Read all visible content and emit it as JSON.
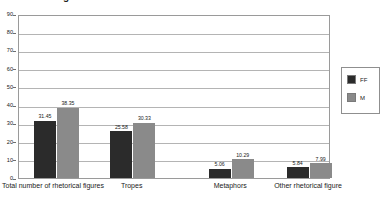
{
  "chart_data": {
    "type": "bar",
    "title": "Rhetorical figures",
    "xlabel": "",
    "ylabel": "",
    "ylim": [
      0,
      90
    ],
    "ytick_step": 10,
    "yticks": [
      0,
      10,
      20,
      30,
      40,
      50,
      60,
      70,
      80,
      90
    ],
    "grid": true,
    "legend_position": "right",
    "categories": [
      "Total number of rhetorical figures",
      "Tropes",
      "Metaphors",
      "Other rhetorical figure"
    ],
    "series": [
      {
        "name": "FF",
        "color": "#2b2b2b",
        "values": [
          31.45,
          25.58,
          5.06,
          5.84
        ],
        "labels": [
          "31.45",
          "25.58",
          "5.06",
          "5.84"
        ]
      },
      {
        "name": "M",
        "color": "#8a8a8a",
        "values": [
          38.35,
          30.33,
          10.29,
          7.99
        ],
        "labels": [
          "38.35",
          "30.33",
          "10.29",
          "7.99"
        ]
      }
    ]
  },
  "legend": {
    "entries": [
      {
        "label": "FF",
        "color": "#2b2b2b"
      },
      {
        "label": "M",
        "color": "#8a8a8a"
      }
    ]
  },
  "colors": {
    "series_ff": "#2b2b2b",
    "series_m": "#8a8a8a",
    "gridline": "#b4b4b4",
    "axis": "#9a9a9a",
    "background": "#ffffff"
  }
}
